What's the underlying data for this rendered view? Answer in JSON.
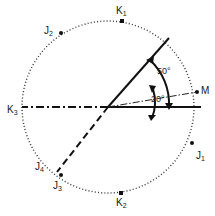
{
  "diagram": {
    "type": "stereonet-style rotation diagram",
    "circle": {
      "cx": 108,
      "cy": 107,
      "r": 86,
      "style": "dotted"
    },
    "points": [
      {
        "id": "K1",
        "base": "K",
        "sub": "1",
        "x": 122,
        "y": 21,
        "lx": 116,
        "ly": 14
      },
      {
        "id": "K2",
        "base": "K",
        "sub": "2",
        "x": 121,
        "y": 193,
        "lx": 116,
        "ly": 206
      },
      {
        "id": "K3",
        "base": "K",
        "sub": "3",
        "x": 22,
        "y": 107,
        "lx": 7,
        "ly": 113
      },
      {
        "id": "J1",
        "base": "J",
        "sub": "1",
        "x": 192,
        "y": 143,
        "lx": 196,
        "ly": 159
      },
      {
        "id": "J2",
        "base": "J",
        "sub": "2",
        "x": 61,
        "y": 33,
        "lx": 44,
        "ly": 34
      },
      {
        "id": "J3",
        "base": "J",
        "sub": "3",
        "x": 61,
        "y": 175,
        "lx": 53,
        "ly": 189
      },
      {
        "id": "J4",
        "base": "J",
        "sub": "4",
        "x": 55,
        "y": 170,
        "lx": 35,
        "ly": 170,
        "marker": false
      },
      {
        "id": "M",
        "base": "M",
        "sub": "",
        "x": 197,
        "y": 92,
        "lx": 201,
        "ly": 94
      }
    ],
    "lines": [
      {
        "name": "reference-line-horizontal",
        "style": "solid",
        "from": [
          108,
          107
        ],
        "to": [
          201,
          107
        ]
      },
      {
        "name": "rotated-line-50deg",
        "style": "solid",
        "from": [
          108,
          107
        ],
        "to": [
          169,
          38
        ]
      },
      {
        "name": "line-to-m-20deg",
        "style": "thin-dash-dot",
        "from": [
          108,
          107
        ],
        "to": [
          197,
          92
        ]
      },
      {
        "name": "line-to-k3",
        "style": "heavy-dash-dot",
        "from": [
          108,
          107
        ],
        "to": [
          22,
          107
        ]
      },
      {
        "name": "line-to-j3",
        "style": "heavy-dash",
        "from": [
          108,
          107
        ],
        "to": [
          57,
          172
        ]
      }
    ],
    "angles": [
      {
        "label": "50°",
        "x": 157,
        "y": 74
      },
      {
        "label": "20°",
        "x": 151,
        "y": 102
      }
    ]
  }
}
